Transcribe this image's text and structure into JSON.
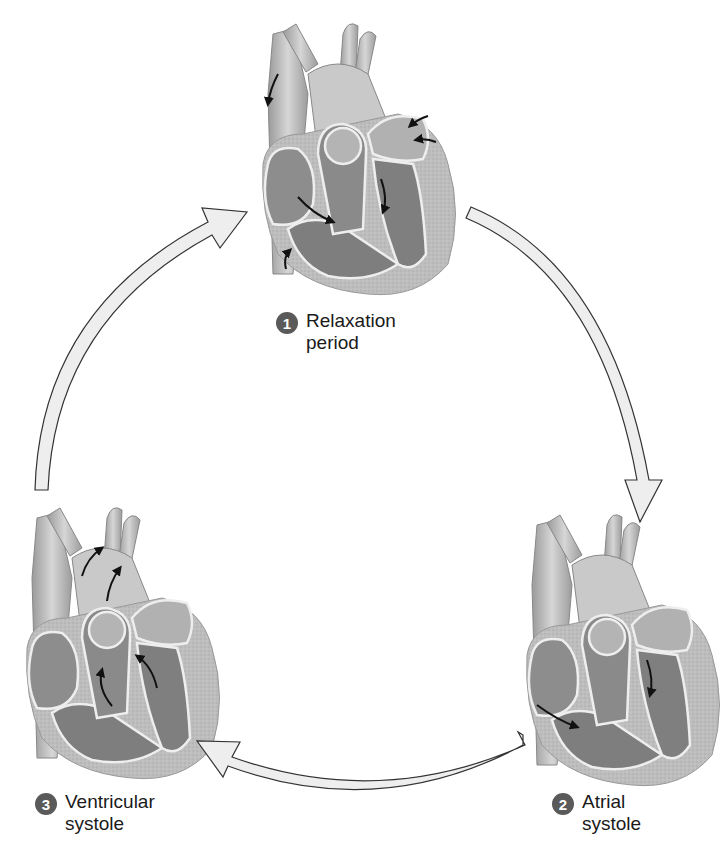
{
  "diagram": {
    "type": "cardiac-cycle",
    "colors": {
      "background": "#ffffff",
      "arrow_fill": "#eeeeee",
      "arrow_stroke": "#333333",
      "badge_fill": "#5a5a5a",
      "badge_text": "#ffffff",
      "flow_arrow": "#111111"
    },
    "stages": [
      {
        "number": "1",
        "line1": "Relaxation",
        "line2": "period",
        "position": "top"
      },
      {
        "number": "2",
        "line1": "Atrial",
        "line2": "systole",
        "position": "bottom-right"
      },
      {
        "number": "3",
        "line1": "Ventricular",
        "line2": "systole",
        "position": "bottom-left"
      }
    ],
    "cycle_arrows": [
      {
        "from": "1",
        "to": "2",
        "direction": "clockwise"
      },
      {
        "from": "2",
        "to": "3",
        "direction": "clockwise"
      },
      {
        "from": "3",
        "to": "1",
        "direction": "clockwise"
      }
    ]
  }
}
